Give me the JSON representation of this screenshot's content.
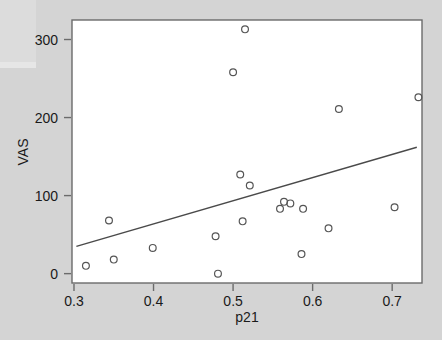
{
  "chart_data": {
    "type": "scatter",
    "title": "",
    "xlabel": "p21",
    "ylabel": "VAS",
    "xlim": [
      0.2975,
      0.7375
    ],
    "ylim": [
      -12,
      325
    ],
    "grid": false,
    "legend": null,
    "x_ticks": [
      0.3,
      0.4,
      0.5,
      0.6,
      0.7
    ],
    "x_tick_labels": [
      "0.3",
      "0.4",
      "0.5",
      "0.6",
      "0.7"
    ],
    "y_ticks": [
      0,
      100,
      200,
      300
    ],
    "y_tick_labels": [
      "0",
      "100",
      "200",
      "300"
    ],
    "marker": "open-circle",
    "marker_color": "#555555",
    "points": [
      {
        "x": 0.315,
        "y": 10
      },
      {
        "x": 0.35,
        "y": 18
      },
      {
        "x": 0.344,
        "y": 68
      },
      {
        "x": 0.399,
        "y": 33
      },
      {
        "x": 0.478,
        "y": 48
      },
      {
        "x": 0.481,
        "y": 0
      },
      {
        "x": 0.5,
        "y": 258
      },
      {
        "x": 0.509,
        "y": 127
      },
      {
        "x": 0.512,
        "y": 67
      },
      {
        "x": 0.515,
        "y": 313
      },
      {
        "x": 0.521,
        "y": 113
      },
      {
        "x": 0.559,
        "y": 83
      },
      {
        "x": 0.564,
        "y": 92
      },
      {
        "x": 0.572,
        "y": 90
      },
      {
        "x": 0.586,
        "y": 25
      },
      {
        "x": 0.588,
        "y": 83
      },
      {
        "x": 0.62,
        "y": 58
      },
      {
        "x": 0.633,
        "y": 211
      },
      {
        "x": 0.703,
        "y": 85
      },
      {
        "x": 0.733,
        "y": 226
      }
    ],
    "fit_line": {
      "name": "linear fit",
      "color": "#4a4a4a",
      "x_start": 0.303,
      "y_start": 35,
      "x_end": 0.731,
      "y_end": 162
    }
  }
}
